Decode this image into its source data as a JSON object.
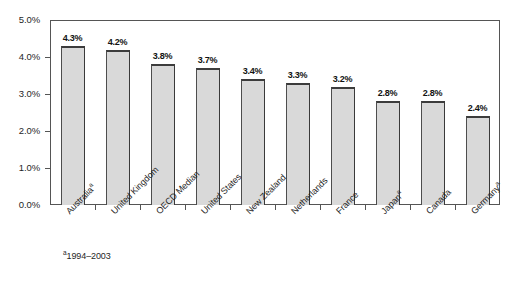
{
  "chart_data": {
    "type": "bar",
    "title": "",
    "subtitle": "",
    "xlabel": "",
    "ylabel": "",
    "ylim": [
      0,
      5
    ],
    "grid": false,
    "legend": "none",
    "categories": [
      "Australiaᵃ",
      "United Kingdom",
      "OECD Median",
      "United States",
      "New Zealand",
      "Netherlands",
      "France",
      "Japanᵃ",
      "Canada",
      "Germanyᵃ"
    ],
    "values": [
      4.3,
      4.2,
      3.8,
      3.7,
      3.4,
      3.3,
      3.2,
      2.8,
      2.8,
      2.4
    ],
    "value_labels": [
      "4.3%",
      "4.2%",
      "3.8%",
      "3.7%",
      "3.4%",
      "3.3%",
      "3.2%",
      "2.8%",
      "2.8%",
      "2.4%"
    ],
    "y_ticks": [
      0,
      1,
      2,
      3,
      4,
      5
    ],
    "y_tick_labels": [
      "0.0%",
      "1.0%",
      "2.0%",
      "3.0%",
      "4.0%",
      "5.0%"
    ],
    "bar_fill_color": "#d9d9d9",
    "bar_border_color": "#3c3c3c",
    "frame_color": "#555555",
    "background_color": "#ffffff",
    "text_color": "#1f1f1f"
  },
  "footnote": {
    "marker": "a",
    "text": "1994–2003"
  },
  "categories_plain": [
    {
      "base": "Australia",
      "sup": "a"
    },
    {
      "base": "United Kingdom",
      "sup": ""
    },
    {
      "base": "OECD Median",
      "sup": ""
    },
    {
      "base": "United States",
      "sup": ""
    },
    {
      "base": "New Zealand",
      "sup": ""
    },
    {
      "base": "Netherlands",
      "sup": ""
    },
    {
      "base": "France",
      "sup": ""
    },
    {
      "base": "Japan",
      "sup": "a"
    },
    {
      "base": "Canada",
      "sup": ""
    },
    {
      "base": "Germany",
      "sup": "a"
    }
  ]
}
